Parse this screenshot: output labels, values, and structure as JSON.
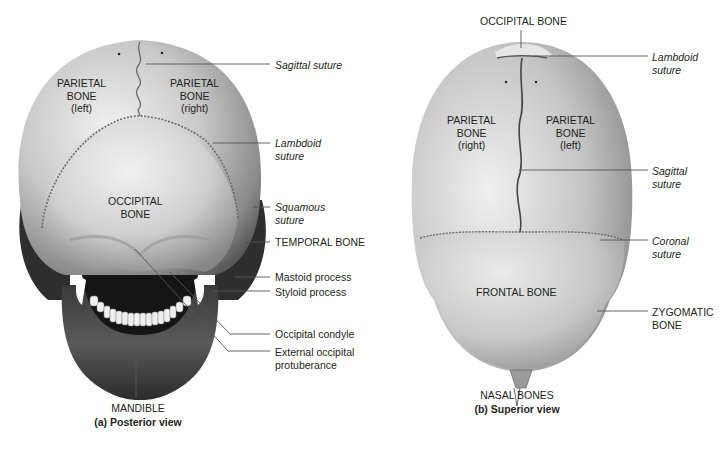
{
  "figure": {
    "panels": [
      {
        "id": "a",
        "caption": "(a) Posterior view",
        "on_bone_labels": {
          "parietal_left": [
            "PARIETAL",
            "BONE",
            "(left)"
          ],
          "parietal_right": [
            "PARIETAL",
            "BONE",
            "(right)"
          ],
          "occipital": [
            "OCCIPITAL",
            "BONE"
          ]
        },
        "callouts": {
          "sagittal_suture": "Sagittal suture",
          "lambdoid_suture": [
            "Lambdoid",
            "suture"
          ],
          "squamous_suture": [
            "Squamous",
            "suture"
          ],
          "temporal_bone": "TEMPORAL BONE",
          "mastoid_process": "Mastoid process",
          "styloid_process": "Styloid process",
          "occipital_condyle": "Occipital condyle",
          "external_occipital_protuberance": [
            "External occipital",
            "protuberance"
          ],
          "mandible": "MANDIBLE"
        }
      },
      {
        "id": "b",
        "caption": "(b) Superior view",
        "on_bone_labels": {
          "parietal_right": [
            "PARIETAL",
            "BONE",
            "(right)"
          ],
          "parietal_left": [
            "PARIETAL",
            "BONE",
            "(left)"
          ],
          "frontal": "FRONTAL BONE"
        },
        "callouts": {
          "occipital_bone": "OCCIPITAL BONE",
          "lambdoid_suture": [
            "Lambdoid",
            "suture"
          ],
          "sagittal_suture": [
            "Sagittal",
            "suture"
          ],
          "coronal_suture": [
            "Coronal",
            "suture"
          ],
          "zygomatic_bone": [
            "ZYGOMATIC",
            "BONE"
          ],
          "nasal_bones": "NASAL BONES"
        }
      }
    ],
    "colors": {
      "bone_light": "#e4e4e4",
      "bone_mid": "#b4b4b4",
      "bone_dark": "#6e6e6e",
      "shadow": "#2a2a2a",
      "leader_line": "#555555",
      "text": "#231f20"
    }
  }
}
